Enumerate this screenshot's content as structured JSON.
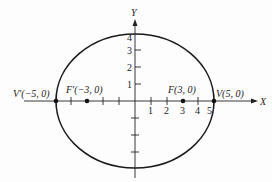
{
  "figure": {
    "type": "ellipse",
    "equation_params": {
      "a": 5,
      "b": 4,
      "c": 3
    },
    "axes": {
      "x_label": "X",
      "y_label": "Y"
    },
    "x_ticks": [
      "1",
      "2",
      "3",
      "4",
      "5"
    ],
    "y_ticks": [
      "1",
      "2",
      "3",
      "4"
    ],
    "points": [
      {
        "name": "V'",
        "coords": "(−5, 0)",
        "label": "V′(−5, 0)"
      },
      {
        "name": "F'",
        "coords": "(−3, 0)",
        "label": "F′(−3, 0)"
      },
      {
        "name": "F",
        "coords": "(3, 0)",
        "label": "F(3, 0)"
      },
      {
        "name": "V",
        "coords": "(5, 0)",
        "label": "V(5, 0)"
      }
    ],
    "colors": {
      "stroke": "#1a1a1a",
      "background": "#fdfdfd"
    }
  }
}
